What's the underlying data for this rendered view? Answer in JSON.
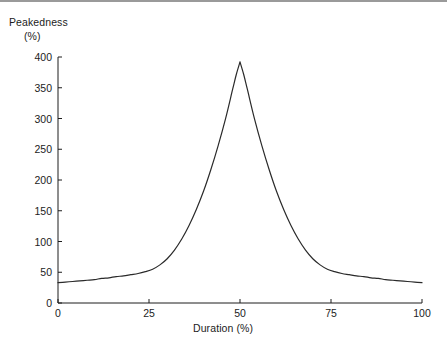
{
  "figure": {
    "background_color": "#ffffff",
    "axis_color": "#1c1c1c",
    "curve_color": "#2a2a2a",
    "top_rule_color": "#9a9a9a"
  },
  "chart_data": {
    "type": "line",
    "title": "",
    "xlabel": "Duration (%)",
    "ylabel": "Peakedness (%)",
    "ylabel_line1": "Peakedness",
    "ylabel_line2": "(%)",
    "xlim": [
      0,
      100
    ],
    "ylim": [
      0,
      400
    ],
    "xticks": [
      0,
      25,
      50,
      75,
      100
    ],
    "yticks": [
      0,
      50,
      100,
      150,
      200,
      250,
      300,
      350,
      400
    ],
    "xtick_labels": [
      "0",
      "25",
      "50",
      "75",
      "100"
    ],
    "ytick_labels": [
      "0",
      "50",
      "100",
      "150",
      "200",
      "250",
      "300",
      "350",
      "400"
    ],
    "grid": false,
    "legend": null,
    "series": [
      {
        "name": "Peakedness",
        "color": "#2a2a2a",
        "line_width": 1.2,
        "x": [
          0,
          2,
          4,
          6,
          8,
          10,
          12,
          14,
          16,
          18,
          20,
          22,
          24,
          26,
          28,
          30,
          32,
          34,
          36,
          38,
          40,
          42,
          44,
          46,
          48,
          49,
          50,
          51,
          52,
          54,
          56,
          58,
          60,
          62,
          64,
          66,
          68,
          70,
          72,
          74,
          76,
          78,
          80,
          82,
          84,
          86,
          88,
          90,
          92,
          94,
          96,
          98,
          100
        ],
        "y": [
          33,
          34,
          35,
          36,
          37,
          38,
          40,
          41,
          43,
          44,
          46,
          48,
          51,
          55,
          62,
          72,
          86,
          104,
          126,
          152,
          182,
          217,
          256,
          299,
          348,
          372,
          392,
          372,
          348,
          299,
          256,
          217,
          182,
          152,
          126,
          104,
          86,
          72,
          62,
          55,
          51,
          48,
          46,
          44,
          43,
          41,
          40,
          38,
          37,
          36,
          35,
          34,
          33
        ]
      }
    ],
    "peak": {
      "x": 50,
      "y": 392
    },
    "endpoints": {
      "left_y": 33,
      "right_y": 33
    }
  }
}
